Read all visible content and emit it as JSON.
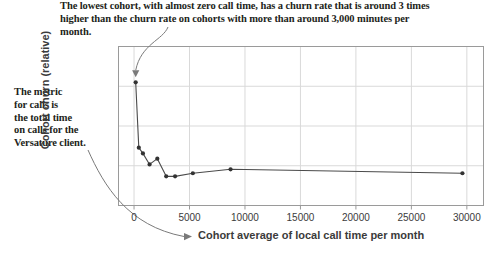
{
  "annotations": {
    "top": {
      "line1": "The lowest cohort, with almost zero call time, has a churn rate that is around 3 times",
      "line2": "higher than the churn rate on cohorts with more than around 3,000 minutes per month."
    },
    "left": {
      "line1": "The metric",
      "line2": "for calls is",
      "line3": "the total time",
      "line4": "on calls for the",
      "line5": "Versature client."
    }
  },
  "colors": {
    "text": "#231f20",
    "axis_text": "#3b3b3b",
    "line": "#4a4a4a",
    "marker": "#333333",
    "grid": "#d9d9d9",
    "frame": "#9a9a9a",
    "callout": "#7a7a7a"
  },
  "chart_data": {
    "type": "line",
    "title": "",
    "xlabel": "Cohort average of local call time per month",
    "ylabel": "Cohort churn (relative)",
    "xlim": [
      -1400,
      31500
    ],
    "ylim": [
      0,
      3.6
    ],
    "xticks": [
      0,
      5000,
      10000,
      15000,
      20000,
      25000,
      30000
    ],
    "xticklabels": [
      "0",
      "5000",
      "10000",
      "15000",
      "20000",
      "25000",
      "30000"
    ],
    "yticks": [
      0.9,
      1.8,
      2.7
    ],
    "yticklabels": [
      "",
      "",
      ""
    ],
    "grid": true,
    "legend": null,
    "series": [
      {
        "name": "Cohort churn (relative)",
        "marker": "circle",
        "x": [
          150,
          430,
          800,
          1400,
          2100,
          2900,
          3700,
          5300,
          8700,
          29600
        ],
        "y": [
          2.79,
          1.31,
          1.18,
          0.93,
          1.06,
          0.66,
          0.66,
          0.73,
          0.82,
          0.73
        ]
      }
    ],
    "callout_target": {
      "x": 150,
      "y": 2.79
    }
  }
}
